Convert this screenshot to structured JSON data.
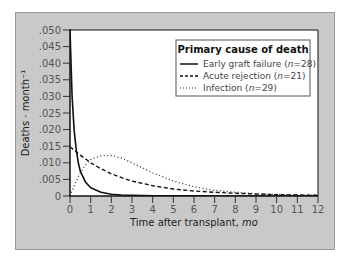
{
  "chart_data": {
    "type": "line",
    "title": "",
    "xlabel": "Time after transplant, mo",
    "xlabel_plain": "Time after transplant, ",
    "xlabel_italic": "mo",
    "ylabel": "Deaths · month⁻¹",
    "xlim": [
      0,
      12
    ],
    "ylim": [
      0,
      0.05
    ],
    "x_ticks": [
      0,
      1,
      2,
      3,
      4,
      5,
      6,
      7,
      8,
      9,
      10,
      11,
      12
    ],
    "x_tick_labels": [
      "0",
      "1",
      "2",
      "3",
      "4",
      "5",
      "6",
      "7",
      "8",
      "9",
      "10",
      "11",
      "12"
    ],
    "y_ticks": [
      0,
      0.005,
      0.01,
      0.015,
      0.02,
      0.025,
      0.03,
      0.035,
      0.04,
      0.045,
      0.05
    ],
    "y_tick_labels": [
      "0",
      ".005",
      ".010",
      ".015",
      ".020",
      ".025",
      ".030",
      ".035",
      ".040",
      ".045",
      ".050"
    ],
    "grid": false,
    "legend": {
      "title": "Primary cause of death",
      "position": "upper right"
    },
    "x": [
      0,
      0.1,
      0.2,
      0.3,
      0.4,
      0.5,
      0.75,
      1,
      1.5,
      2,
      2.5,
      3,
      4,
      5,
      6,
      7,
      8,
      9,
      10,
      11,
      12
    ],
    "series": [
      {
        "name": "Early graft failure",
        "n": 28,
        "style": "solid",
        "values": [
          0.05,
          0.03,
          0.02,
          0.014,
          0.01,
          0.0075,
          0.0042,
          0.0025,
          0.0011,
          0.0005,
          0.0003,
          0.0002,
          0.0001,
          0.0001,
          0.0001,
          0,
          0,
          0,
          0,
          0,
          0
        ]
      },
      {
        "name": "Acute rejection",
        "n": 21,
        "style": "dashed",
        "values": [
          0.0148,
          0.0143,
          0.0138,
          0.0133,
          0.0128,
          0.0123,
          0.0112,
          0.01,
          0.0082,
          0.0067,
          0.0055,
          0.0045,
          0.0031,
          0.0021,
          0.0015,
          0.0011,
          0.0008,
          0.0006,
          0.0004,
          0.0003,
          0.0002
        ]
      },
      {
        "name": "Infection",
        "n": 29,
        "style": "dotted",
        "values": [
          0,
          0.0015,
          0.003,
          0.0045,
          0.0058,
          0.007,
          0.0094,
          0.011,
          0.0121,
          0.0122,
          0.0114,
          0.01,
          0.007,
          0.0045,
          0.0028,
          0.0017,
          0.0011,
          0.0007,
          0.0005,
          0.0003,
          0.0002
        ]
      }
    ]
  },
  "legend_items": [
    {
      "label": "Early graft failure (",
      "n_italic": "n",
      "n_value": "=28)"
    },
    {
      "label": "Acute rejection (",
      "n_italic": "n",
      "n_value": "=21)"
    },
    {
      "label": "Infection (",
      "n_italic": "n",
      "n_value": "=29)"
    }
  ]
}
